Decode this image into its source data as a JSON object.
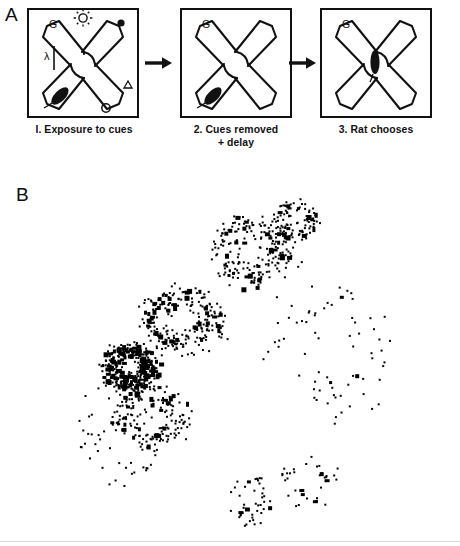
{
  "figure": {
    "panel_a_letter": "A",
    "panel_b_letter": "B"
  },
  "panel_a": {
    "steps": [
      {
        "id": "step-1",
        "caption": "I. Exposure to cues",
        "cues": [
          {
            "name": "goal-letter-cue",
            "symbol": "G",
            "position": "top-left-arm"
          },
          {
            "name": "lamp-cue",
            "symbol": "lamp-icon",
            "position": "top-center"
          },
          {
            "name": "black-dot-cue",
            "symbol": "filled-circle",
            "position": "top-right-arm-end"
          },
          {
            "name": "lambda-cue",
            "symbol": "λ",
            "position": "left-wall"
          },
          {
            "name": "bar-cue",
            "symbol": "vertical-bar",
            "position": "left-wall"
          },
          {
            "name": "triangle-cue",
            "symbol": "Δ",
            "position": "right-wall"
          },
          {
            "name": "circle-cue",
            "symbol": "O",
            "position": "bottom-right"
          }
        ],
        "rat_position": "lower-left-arm"
      },
      {
        "id": "step-2",
        "caption": "2. Cues removed\n+ delay",
        "cues": [
          {
            "name": "goal-letter-cue",
            "symbol": "G",
            "position": "top-left-arm"
          }
        ],
        "rat_position": "lower-left-arm"
      },
      {
        "id": "step-3",
        "caption": "3. Rat chooses",
        "cues": [
          {
            "name": "goal-letter-cue",
            "symbol": "G",
            "position": "top-left-arm"
          }
        ],
        "rat_position": "center-hub"
      }
    ],
    "arrows": [
      "arrow-right",
      "arrow-right"
    ]
  },
  "chart_data": {
    "type": "scatter",
    "title": "",
    "xlabel": "",
    "ylabel": "",
    "grid": false,
    "legend": null,
    "xlim": [
      0,
      460
    ],
    "ylim": [
      0,
      376
    ],
    "marker": {
      "shape": "square",
      "color": "#000000",
      "size_px": 2
    },
    "clusters": [
      {
        "name": "dense-lower-left-cluster",
        "cx": 128,
        "cy": 196,
        "rx": 34,
        "ry": 30,
        "density": "high",
        "n": 300
      },
      {
        "name": "mid-band",
        "cx": 180,
        "cy": 150,
        "rx": 55,
        "ry": 45,
        "density": "medium",
        "n": 230
      },
      {
        "name": "upper-right-band",
        "cx": 250,
        "cy": 80,
        "rx": 55,
        "ry": 45,
        "density": "medium",
        "n": 210
      },
      {
        "name": "upper-tip",
        "cx": 295,
        "cy": 48,
        "rx": 30,
        "ry": 26,
        "density": "medium",
        "n": 90
      },
      {
        "name": "lower-band",
        "cx": 150,
        "cy": 245,
        "rx": 50,
        "ry": 40,
        "density": "medium",
        "n": 150
      },
      {
        "name": "v-trail-left",
        "cx": 250,
        "cy": 330,
        "rx": 28,
        "ry": 34,
        "density": "low",
        "n": 45
      },
      {
        "name": "v-trail-right",
        "cx": 305,
        "cy": 310,
        "rx": 38,
        "ry": 35,
        "density": "low",
        "n": 35
      },
      {
        "name": "sparse-right-field",
        "cx": 330,
        "cy": 180,
        "rx": 80,
        "ry": 90,
        "density": "very-low",
        "n": 70
      },
      {
        "name": "sparse-left-field",
        "cx": 120,
        "cy": 260,
        "rx": 60,
        "ry": 70,
        "density": "very-low",
        "n": 60
      }
    ]
  }
}
